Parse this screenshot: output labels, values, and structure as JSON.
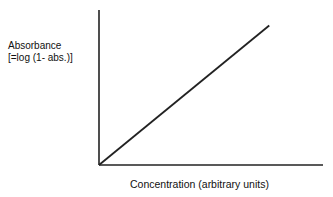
{
  "chart_data": {
    "type": "line",
    "title": "",
    "xlabel": "Concentration (arbitrary units)",
    "ylabel": [
      "Absorbance",
      "[=log (1- abs.)]"
    ],
    "x": [
      0,
      1
    ],
    "series": [
      {
        "name": "Absorbance vs Concentration",
        "values": [
          0,
          0.9
        ],
        "x": [
          0,
          0.76
        ]
      }
    ],
    "xlim": [
      0,
      1
    ],
    "ylim": [
      0,
      1
    ],
    "ticks": "none",
    "grid": false,
    "legend": "none"
  },
  "labels": {
    "y_line1": "Absorbance",
    "y_line2": "[=log (1- abs.)]",
    "x": "Concentration (arbitrary units)"
  }
}
